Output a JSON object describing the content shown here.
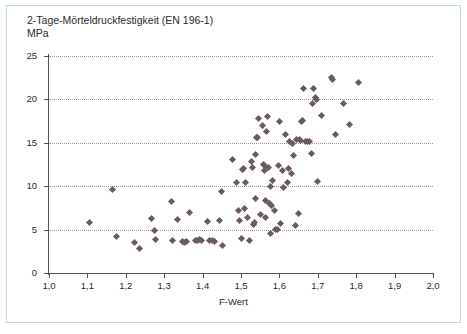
{
  "figure": {
    "title_line1": "2-Tage-Mörteldruckfestigkeit (EN 196-1)",
    "title_line2": "MPa",
    "frame_color": "#bcd9e8",
    "marker_color": "#6b5b5b",
    "axis_color": "#555555",
    "grid_color": "#9a9a9a"
  },
  "chart_data": {
    "type": "scatter",
    "title": "2-Tage-Mörteldruckfestigkeit (EN 196-1)",
    "subtitle": "MPa",
    "xlabel": "F-Wert",
    "ylabel": "MPa",
    "xlim": [
      1.0,
      2.0
    ],
    "ylim": [
      0,
      25
    ],
    "xticks": [
      1.0,
      1.1,
      1.2,
      1.3,
      1.4,
      1.5,
      1.6,
      1.7,
      1.8,
      1.9,
      2.0
    ],
    "xtick_labels": [
      "1,0",
      "1,1",
      "1,2",
      "1,3",
      "1,4",
      "1,5",
      "1,6",
      "1,7",
      "1,8",
      "1,9",
      "2,0"
    ],
    "yticks": [
      0,
      5,
      10,
      15,
      20,
      25
    ],
    "ytick_labels": [
      "0",
      "5",
      "10",
      "15",
      "20",
      "25"
    ],
    "grid": "horizontal-dotted",
    "legend": null,
    "marker": "diamond",
    "series": [
      {
        "name": "2-Tage-Mörteldruckfestigkeit",
        "points": [
          [
            1.106,
            5.8
          ],
          [
            1.166,
            9.6
          ],
          [
            1.175,
            4.2
          ],
          [
            1.222,
            3.5
          ],
          [
            1.235,
            2.8
          ],
          [
            1.268,
            6.3
          ],
          [
            1.274,
            4.9
          ],
          [
            1.277,
            3.9
          ],
          [
            1.318,
            8.2
          ],
          [
            1.322,
            3.7
          ],
          [
            1.334,
            6.2
          ],
          [
            1.347,
            3.6
          ],
          [
            1.353,
            3.5
          ],
          [
            1.359,
            3.6
          ],
          [
            1.366,
            7.0
          ],
          [
            1.382,
            3.8
          ],
          [
            1.388,
            3.8
          ],
          [
            1.393,
            3.9
          ],
          [
            1.398,
            3.7
          ],
          [
            1.414,
            5.9
          ],
          [
            1.418,
            3.7
          ],
          [
            1.425,
            3.8
          ],
          [
            1.431,
            3.6
          ],
          [
            1.444,
            6.1
          ],
          [
            1.448,
            9.4
          ],
          [
            1.451,
            3.2
          ],
          [
            1.478,
            13.1
          ],
          [
            1.489,
            10.4
          ],
          [
            1.494,
            7.2
          ],
          [
            1.497,
            6.1
          ],
          [
            1.501,
            4.0
          ],
          [
            1.503,
            11.9
          ],
          [
            1.506,
            12.0
          ],
          [
            1.508,
            7.4
          ],
          [
            1.513,
            10.4
          ],
          [
            1.517,
            6.4
          ],
          [
            1.521,
            3.7
          ],
          [
            1.527,
            12.8
          ],
          [
            1.53,
            12.1
          ],
          [
            1.532,
            5.6
          ],
          [
            1.534,
            5.8
          ],
          [
            1.537,
            13.6
          ],
          [
            1.539,
            8.6
          ],
          [
            1.541,
            15.6
          ],
          [
            1.543,
            15.6
          ],
          [
            1.546,
            17.8
          ],
          [
            1.551,
            6.7
          ],
          [
            1.556,
            17.0
          ],
          [
            1.558,
            12.5
          ],
          [
            1.56,
            11.8
          ],
          [
            1.562,
            12.4
          ],
          [
            1.563,
            8.3
          ],
          [
            1.565,
            6.4
          ],
          [
            1.567,
            16.3
          ],
          [
            1.569,
            18.0
          ],
          [
            1.571,
            12.2
          ],
          [
            1.573,
            8.0
          ],
          [
            1.576,
            10.0
          ],
          [
            1.578,
            4.6
          ],
          [
            1.58,
            7.8
          ],
          [
            1.583,
            10.6
          ],
          [
            1.588,
            7.2
          ],
          [
            1.591,
            5.0
          ],
          [
            1.594,
            5.0
          ],
          [
            1.597,
            12.4
          ],
          [
            1.601,
            17.4
          ],
          [
            1.604,
            5.7
          ],
          [
            1.607,
            11.8
          ],
          [
            1.611,
            9.8
          ],
          [
            1.616,
            15.9
          ],
          [
            1.62,
            10.4
          ],
          [
            1.624,
            12.0
          ],
          [
            1.627,
            15.1
          ],
          [
            1.631,
            11.5
          ],
          [
            1.634,
            14.9
          ],
          [
            1.637,
            13.5
          ],
          [
            1.641,
            5.5
          ],
          [
            1.645,
            15.4
          ],
          [
            1.649,
            6.8
          ],
          [
            1.652,
            15.4
          ],
          [
            1.655,
            15.3
          ],
          [
            1.658,
            17.4
          ],
          [
            1.661,
            17.6
          ],
          [
            1.664,
            21.3
          ],
          [
            1.668,
            15.1
          ],
          [
            1.672,
            15.2
          ],
          [
            1.679,
            15.1
          ],
          [
            1.683,
            13.8
          ],
          [
            1.687,
            19.5
          ],
          [
            1.69,
            21.3
          ],
          [
            1.693,
            20.2
          ],
          [
            1.696,
            20.0
          ],
          [
            1.7,
            10.5
          ],
          [
            1.709,
            18.2
          ],
          [
            1.736,
            22.5
          ],
          [
            1.739,
            22.3
          ],
          [
            1.745,
            16.0
          ],
          [
            1.766,
            19.5
          ],
          [
            1.782,
            17.1
          ],
          [
            1.805,
            22.0
          ]
        ]
      }
    ]
  }
}
